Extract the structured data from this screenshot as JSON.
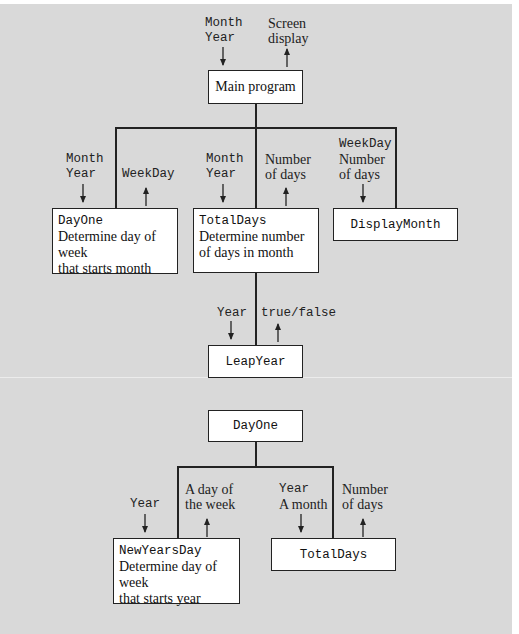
{
  "diagram": {
    "type": "structure-chart",
    "top_chart": {
      "main": {
        "label": "Main program",
        "inputs": [
          "Month",
          "Year"
        ],
        "outputs": [
          "Screen",
          "display"
        ]
      },
      "modules": [
        {
          "name": "DayOne",
          "desc1": "Determine day of week",
          "desc2": "that starts month",
          "in1": "Month",
          "in2": "Year",
          "out1": "WeekDay"
        },
        {
          "name": "TotalDays",
          "desc1": "Determine number",
          "desc2": "of days in month",
          "in1": "Month",
          "in2": "Year",
          "out1": "Number",
          "out2": "of days"
        },
        {
          "name": "DisplayMonth",
          "in1": "WeekDay",
          "in2": "Number",
          "in3": "of days"
        }
      ],
      "leap": {
        "name": "LeapYear",
        "in1": "Year",
        "out1": "true/false"
      }
    },
    "bottom_chart": {
      "root": {
        "name": "DayOne"
      },
      "modules": [
        {
          "name": "NewYearsDay",
          "desc1": "Determine day of week",
          "desc2": "that starts year",
          "in1": "Year",
          "out1": "A day of",
          "out2": "the week"
        },
        {
          "name": "TotalDays",
          "in1": "Year",
          "in2": "A month",
          "out1": "Number",
          "out2": "of days"
        }
      ]
    }
  }
}
